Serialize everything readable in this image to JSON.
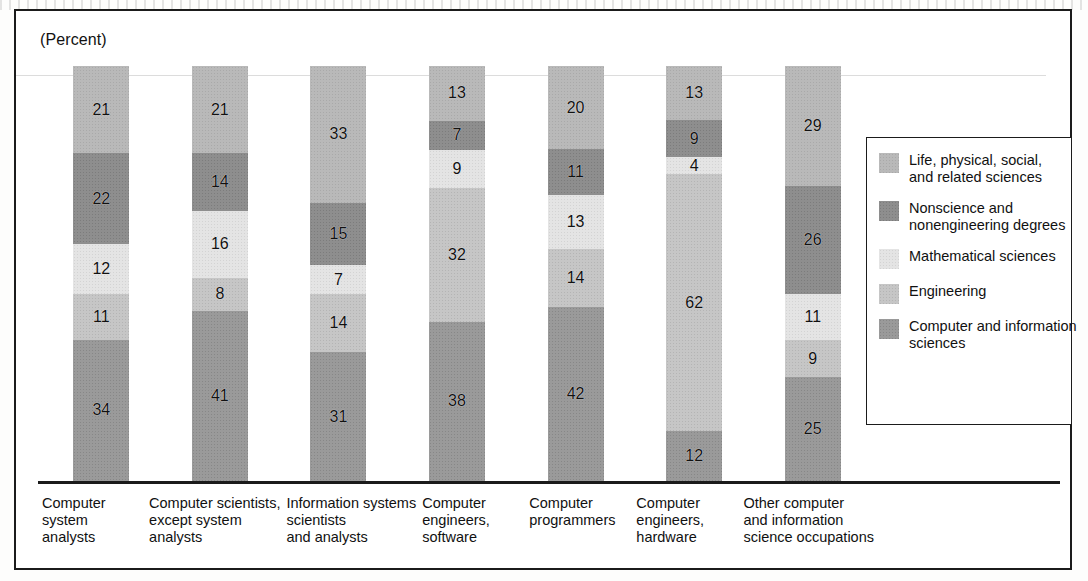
{
  "axis_note": "(Percent)",
  "chart_data": {
    "type": "bar",
    "title": "",
    "subtitle": "",
    "xlabel": "",
    "ylabel": "(Percent)",
    "ylim": [
      0,
      100
    ],
    "stacked": true,
    "stack_total": 100,
    "grid": true,
    "gridlines": [
      85
    ],
    "legend_position": "right",
    "categories": [
      "Computer system analysts",
      "Computer scientists, except system analysts",
      "Information systems scientists and analysts",
      "Computer engineers, software",
      "Computer programmers",
      "Computer engineers, hardware",
      "Other computer and information science occupations"
    ],
    "category_lines": [
      [
        "Computer",
        "system",
        "analysts"
      ],
      [
        "Computer scientists,",
        "except system",
        "analysts"
      ],
      [
        "Information systems",
        "scientists",
        "and analysts"
      ],
      [
        "Computer",
        "engineers,",
        "software"
      ],
      [
        "Computer",
        "programmers",
        ""
      ],
      [
        "Computer",
        "engineers,",
        "hardware"
      ],
      [
        "Other computer",
        "and information",
        "science occupations"
      ]
    ],
    "series_order_top_to_bottom": [
      "Life, physical, social, and related sciences",
      "Nonscience and nonengineering degrees",
      "Mathematical sciences",
      "Engineering",
      "Computer and information sciences"
    ],
    "series": [
      {
        "name": "Life, physical, social, and related sciences",
        "color": "#b9b9b9",
        "values": [
          21,
          21,
          33,
          13,
          20,
          13,
          29
        ]
      },
      {
        "name": "Nonscience and nonengineering degrees",
        "color": "#8e8e8e",
        "values": [
          22,
          14,
          15,
          7,
          11,
          9,
          26
        ]
      },
      {
        "name": "Mathematical sciences",
        "color": "#e4e4e4",
        "values": [
          12,
          16,
          7,
          9,
          13,
          4,
          11
        ]
      },
      {
        "name": "Engineering",
        "color": "#c6c6c6",
        "values": [
          11,
          8,
          14,
          32,
          14,
          62,
          9
        ]
      },
      {
        "name": "Computer and information sciences",
        "color": "#9a9a9a",
        "values": [
          34,
          41,
          31,
          38,
          42,
          12,
          25
        ]
      }
    ]
  },
  "legend": {
    "items": [
      {
        "color": "#b9b9b9",
        "lines": [
          "Life, physical, social,",
          "and related sciences"
        ]
      },
      {
        "color": "#8e8e8e",
        "lines": [
          "Nonscience and",
          "nonengineering degrees"
        ]
      },
      {
        "color": "#e4e4e4",
        "lines": [
          "Mathematical sciences",
          ""
        ]
      },
      {
        "color": "#c6c6c6",
        "lines": [
          "Engineering",
          ""
        ]
      },
      {
        "color": "#9a9a9a",
        "lines": [
          "Computer and information",
          "sciences"
        ]
      }
    ]
  }
}
